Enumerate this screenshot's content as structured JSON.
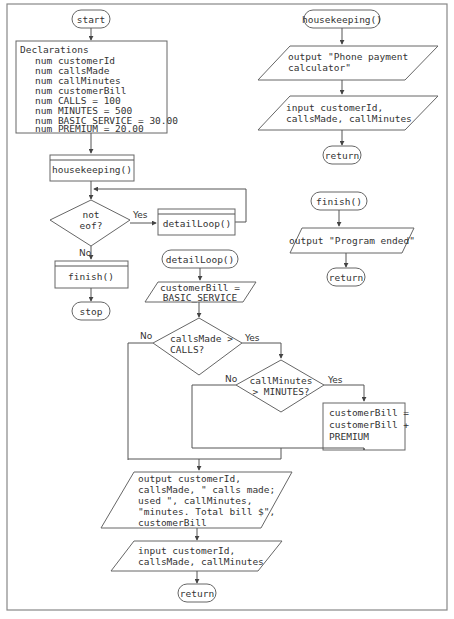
{
  "main": {
    "start": "start",
    "declarations": {
      "title": "Declarations",
      "lines": [
        "num customerId",
        "num callsMade",
        "num callMinutes",
        "num customerBill",
        "num CALLS = 100",
        "num MINUTES = 500",
        "num BASIC_SERVICE = 30.00",
        "num PREMIUM = 20.00"
      ]
    },
    "housekeeping_call": "housekeeping()",
    "loop_decision": [
      "not",
      "eof?"
    ],
    "yes": "Yes",
    "no": "No",
    "detail_call": "detailLoop()",
    "finish_call": "finish()",
    "stop": "stop"
  },
  "housekeeping": {
    "header": "housekeeping()",
    "output": [
      "output \"Phone payment",
      "calculator\""
    ],
    "input": [
      "input customerId,",
      "callsMade, callMinutes"
    ],
    "return": "return"
  },
  "finish": {
    "header": "finish()",
    "output": "output \"Program ended\"",
    "return": "return"
  },
  "detailLoop": {
    "header": "detailLoop()",
    "assign": [
      "customerBill =",
      "BASIC_SERVICE"
    ],
    "decision1": [
      "callsMade >",
      "CALLS?"
    ],
    "decision2": [
      "callMinutes",
      "> MINUTES?"
    ],
    "yes": "Yes",
    "no": "No",
    "premium": [
      "customerBill =",
      "customerBill +",
      "PREMIUM"
    ],
    "output": [
      "output customerId,",
      "callsMade, \" calls made;",
      "used \", callMinutes,",
      "\"minutes. Total bill $\",",
      "customerBill"
    ],
    "input": [
      "input customerId,",
      "callsMade, callMinutes"
    ],
    "return": "return"
  }
}
